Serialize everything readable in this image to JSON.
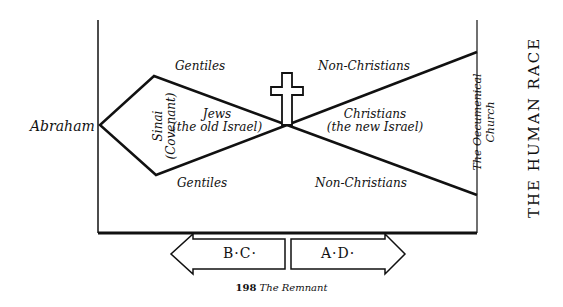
{
  "diagram": {
    "left_label": "Abraham",
    "right_title": "THE HUMAN RACE",
    "pre_christ": {
      "upper_outside": "Gentiles",
      "lower_outside": "Gentiles",
      "covenant_line1": "Sinai",
      "covenant_line2": "(Covenant)",
      "inner_line1": "Jews",
      "inner_line2": "(the old Israel)"
    },
    "post_christ": {
      "upper_outside": "Non-Christians",
      "lower_outside": "Non-Christians",
      "inner_line1": "Christians",
      "inner_line2": "(the new Israel)",
      "end_line1": "The Oecumenical",
      "end_line2": "Church"
    },
    "center_symbol": "cross-icon",
    "timeline": {
      "left_arrow": "B·C·",
      "right_arrow": "A·D·"
    }
  },
  "caption": {
    "page_number": "198",
    "title": "The Remnant"
  },
  "colors": {
    "ink": "#111111",
    "background": "#ffffff"
  }
}
